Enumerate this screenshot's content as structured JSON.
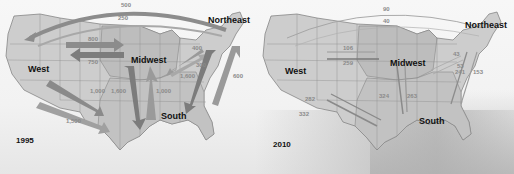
{
  "colors": {
    "land": "#c8c8c8",
    "midwest_south_shade": "#b4b4b4",
    "state_border": "#7a7a7a",
    "arrow": "#8c8c8c",
    "arc": "#9a9a9a",
    "text": "#111111",
    "value_text": "#8a8a8a"
  },
  "regions": {
    "west": "West",
    "midwest": "Midwest",
    "northeast": "Northeast",
    "south": "South"
  },
  "maps": [
    {
      "year": "1995",
      "flows": [
        {
          "label": "500",
          "from": "Northeast",
          "to": "West",
          "shape": "arc-outer"
        },
        {
          "label": "250",
          "from": "West",
          "to": "Northeast",
          "shape": "arc-inner"
        },
        {
          "label": "800",
          "from": "West",
          "to": "Midwest"
        },
        {
          "label": "750",
          "from": "Midwest",
          "to": "West"
        },
        {
          "label": "400",
          "from": "Northeast",
          "to": "Midwest"
        },
        {
          "label": "300",
          "from": "Midwest",
          "to": "Northeast"
        },
        {
          "label": "1,600",
          "from": "Northeast",
          "to": "South"
        },
        {
          "label": "600",
          "from": "South",
          "to": "Northeast"
        },
        {
          "label": "1,000",
          "from": "South",
          "to": "West"
        },
        {
          "label": "1,500",
          "from": "West",
          "to": "South"
        },
        {
          "label": "1,600",
          "from": "Midwest",
          "to": "South"
        },
        {
          "label": "1,000",
          "from": "South",
          "to": "Midwest"
        }
      ]
    },
    {
      "year": "2010",
      "flows": [
        {
          "label": "90",
          "from": "Northeast",
          "to": "West",
          "shape": "arc-outer"
        },
        {
          "label": "40",
          "from": "West",
          "to": "Northeast",
          "shape": "arc-inner"
        },
        {
          "label": "106",
          "from": "West",
          "to": "Midwest"
        },
        {
          "label": "259",
          "from": "Midwest",
          "to": "West"
        },
        {
          "label": "43",
          "from": "Northeast",
          "to": "Midwest"
        },
        {
          "label": "53",
          "from": "Midwest",
          "to": "Northeast"
        },
        {
          "label": "241",
          "from": "Northeast",
          "to": "South"
        },
        {
          "label": "153",
          "from": "South",
          "to": "Northeast"
        },
        {
          "label": "282",
          "from": "South",
          "to": "West"
        },
        {
          "label": "332",
          "from": "West",
          "to": "South"
        },
        {
          "label": "324",
          "from": "Midwest",
          "to": "South"
        },
        {
          "label": "263",
          "from": "South",
          "to": "Midwest"
        }
      ]
    }
  ]
}
